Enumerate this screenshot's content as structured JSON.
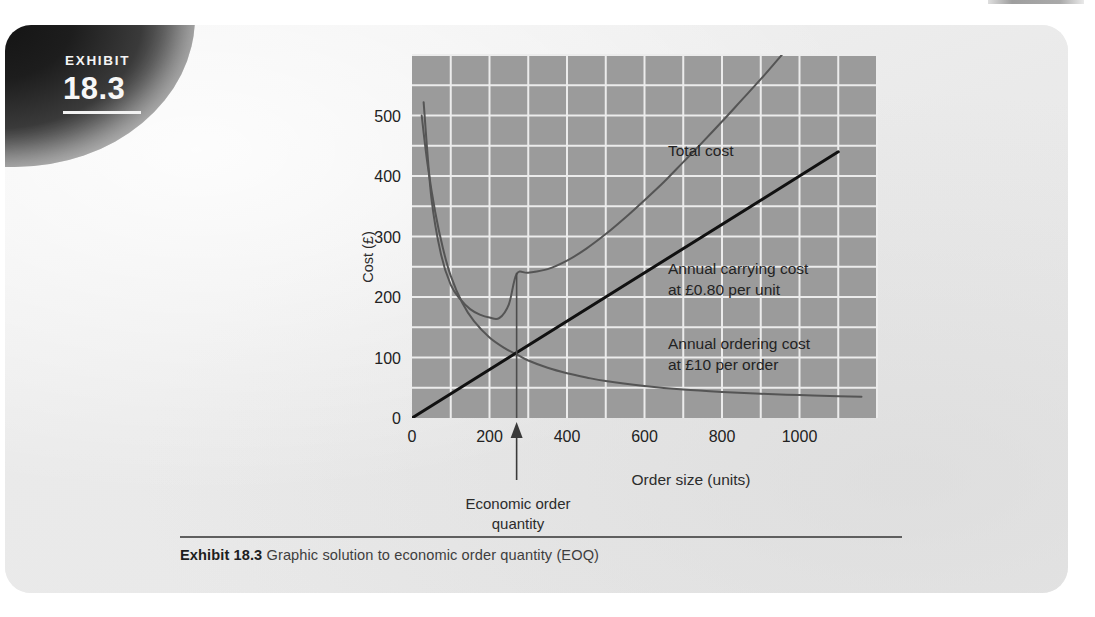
{
  "exhibit": {
    "label": "EXHIBIT",
    "number": "18.3"
  },
  "caption": {
    "strong": "Exhibit 18.3",
    "text": "Graphic solution to economic order quantity (EOQ)"
  },
  "chart_data": {
    "type": "line",
    "title": "",
    "xlabel": "Order size (units)",
    "ylabel": "Cost (£)",
    "xlim": [
      0,
      1200
    ],
    "ylim": [
      0,
      600
    ],
    "xticks": [
      0,
      200,
      400,
      600,
      800,
      1000
    ],
    "xticklabels": [
      "0",
      "200",
      "400",
      "600",
      "800",
      "1000"
    ],
    "yticks": [
      0,
      100,
      200,
      300,
      400,
      500
    ],
    "yticklabels": [
      "0",
      "100",
      "200",
      "300",
      "400",
      "500"
    ],
    "grid": true,
    "grid_step_x": 100,
    "grid_step_y": 50,
    "plot_background": "#9b9b9b",
    "grid_color": "#ececec",
    "legend": "none",
    "series": [
      {
        "name": "Total cost",
        "label": "Total cost",
        "color": "#555555",
        "width": 2.0,
        "formula": "10*D/Q + 0.80*Q/2, D=72000",
        "x": [
          30,
          50,
          75,
          100,
          125,
          150,
          175,
          200,
          225,
          250,
          270,
          300,
          350,
          400,
          450,
          500,
          550,
          600,
          650,
          700,
          750,
          800,
          850,
          900,
          950,
          1000,
          1050,
          1080
        ],
        "y": [
          522,
          364,
          270,
          220,
          196,
          180,
          171,
          166,
          165,
          188,
          238,
          240,
          246,
          260,
          280,
          304,
          331,
          360,
          390,
          423,
          456,
          490,
          525,
          560,
          597,
          634,
          670,
          692
        ]
      },
      {
        "name": "Annual ordering cost",
        "label": "Annual ordering cost\nat £10 per order",
        "label_line1": "Annual ordering cost",
        "label_line2": "at £10 per order",
        "color": "#555555",
        "width": 2.0,
        "formula": "10 * D / Q",
        "x": [
          25,
          40,
          60,
          80,
          100,
          130,
          160,
          200,
          240,
          270,
          300,
          350,
          400,
          450,
          500,
          600,
          700,
          800,
          900,
          1000,
          1100,
          1160
        ],
        "y": [
          500,
          420,
          340,
          280,
          235,
          190,
          160,
          133,
          115,
          105,
          95,
          83,
          74,
          67,
          61,
          53,
          47,
          43,
          40,
          38,
          36,
          35
        ]
      },
      {
        "name": "Annual carrying cost",
        "label": "Annual carrying cost\nat £0.80 per unit",
        "label_line1": "Annual carrying cost",
        "label_line2": "at £0.80 per unit",
        "color": "#111111",
        "width": 3.0,
        "formula": "0.80 * Q / 2",
        "x": [
          0,
          1100
        ],
        "y": [
          0,
          440
        ]
      }
    ],
    "annotations": [
      {
        "name": "eoq-marker",
        "text_line1": "Economic order",
        "text_line2": "quantity",
        "x": 270,
        "value_label": "Economic order quantity",
        "vline_from_y": 0,
        "vline_to_y": 240,
        "arrow": "up"
      },
      {
        "name": "total-cost-label",
        "text": "Total cost",
        "x": 660,
        "y": 430
      },
      {
        "name": "carrying-cost-label",
        "text_line1": "Annual carrying cost",
        "text_line2": "at £0.80 per unit",
        "x": 640,
        "y": 255
      },
      {
        "name": "ordering-cost-label",
        "text_line1": "Annual ordering cost",
        "text_line2": "at £10 per order",
        "x": 640,
        "y": 120
      }
    ],
    "eoq": {
      "quantity": 270,
      "total_cost_at_eoq": 240,
      "crossing_cost": 115
    }
  }
}
